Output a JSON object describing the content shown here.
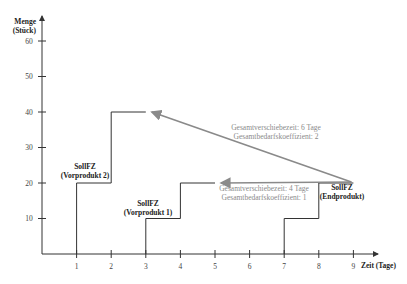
{
  "chart_data": {
    "type": "line",
    "title": "",
    "xlabel": "Zeit (Tage)",
    "ylabel_line1": "Menge",
    "ylabel_line2": "(Stück)",
    "xlim": [
      0,
      10
    ],
    "ylim": [
      0,
      66
    ],
    "x_ticks": [
      1,
      2,
      3,
      4,
      5,
      6,
      7,
      8,
      9
    ],
    "y_ticks": [
      10,
      20,
      30,
      40,
      50,
      60
    ],
    "grid": false,
    "series": [
      {
        "name": "SollFZ (Vorprodukt 2)",
        "label_line1": "SollFZ",
        "label_line2": "(Vorprodukt 2)",
        "points": [
          [
            1,
            0
          ],
          [
            1,
            20
          ],
          [
            2,
            20
          ],
          [
            2,
            40
          ],
          [
            3,
            40
          ]
        ]
      },
      {
        "name": "SollFZ (Vorprodukt 1)",
        "label_line1": "SollFZ",
        "label_line2": "(Vorprodukt 1)",
        "points": [
          [
            3,
            0
          ],
          [
            3,
            10
          ],
          [
            4,
            10
          ],
          [
            4,
            20
          ],
          [
            5,
            20
          ]
        ]
      },
      {
        "name": "SollFZ (Endprodukt)",
        "label_line1": "SollFZ",
        "label_line2": "(Endprodukt)",
        "points": [
          [
            7,
            0
          ],
          [
            7,
            10
          ],
          [
            8,
            10
          ],
          [
            8,
            20
          ],
          [
            9,
            20
          ]
        ]
      }
    ],
    "arrows": [
      {
        "name": "shift-to-vorprodukt-2",
        "from": [
          9,
          20
        ],
        "to": [
          3,
          40
        ],
        "line1": "Gesamtverschiebezeit: 6 Tage",
        "line2": "Gesamtbedarfskoeffizient: 2"
      },
      {
        "name": "shift-to-vorprodukt-1",
        "from": [
          9,
          20
        ],
        "to": [
          5,
          20
        ],
        "line1": "Gesamtverschiebezeit: 4 Tage",
        "line2": "Gesamtbedarfskoeffizient: 1"
      }
    ],
    "colors": {
      "step_line": "#333333",
      "arrow": "#8a8a8a",
      "axis": "#333333"
    }
  }
}
